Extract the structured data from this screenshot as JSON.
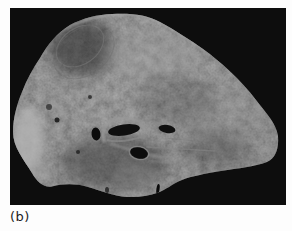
{
  "figure": {
    "panel_label": "(b)",
    "content_description": "Gross pathology photograph: cut surface of a mottled gray tissue specimen (lung section) with dark vessel and airway openings, pale fibrous streaks and a bright left margin, photographed on a black background",
    "photo_background": "#0d0d0d",
    "page_background": "#ffffff",
    "specimen_base_color": "#4a4a4a",
    "specimen_highlight_color": "#b0b0b0",
    "specimen_shadow_color": "#151515",
    "label_color": "#1c1c1c"
  }
}
